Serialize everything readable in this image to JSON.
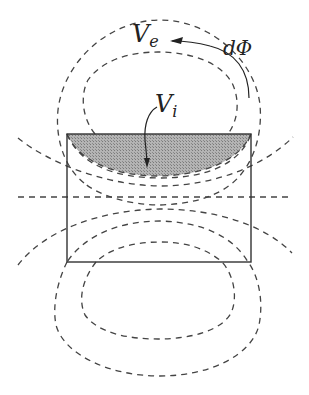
{
  "diagram": {
    "labels": {
      "external_volume": "V",
      "external_volume_sub": "e",
      "internal_volume": "V",
      "internal_volume_sub": "i",
      "flux_element": "dΦ"
    },
    "colors": {
      "line": "#444444",
      "shaded_region": "#a8a8a8",
      "rectangle": "#333333"
    }
  }
}
